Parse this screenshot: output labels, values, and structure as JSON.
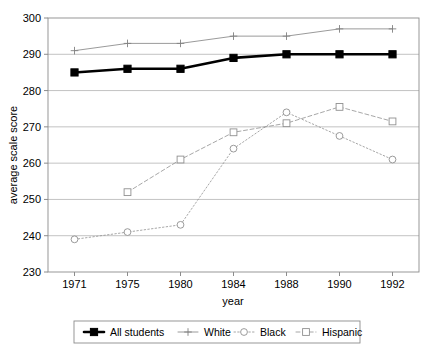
{
  "chart_data": {
    "type": "line",
    "title": "",
    "xlabel": "year",
    "ylabel": "average scale score",
    "categories": [
      "1971",
      "1975",
      "1980",
      "1984",
      "1988",
      "1990",
      "1992"
    ],
    "ylim": [
      230,
      300
    ],
    "yticks": [
      "230",
      "240",
      "250",
      "260",
      "270",
      "280",
      "290",
      "300"
    ],
    "grid": true,
    "legend_position": "bottom",
    "series": [
      {
        "name": "All students",
        "marker": "filled-square",
        "line_style": "solid",
        "color": "#000000",
        "line_width": 2.6,
        "values": [
          285,
          286,
          286,
          289,
          290,
          290,
          290
        ]
      },
      {
        "name": "White",
        "marker": "plus",
        "line_style": "solid",
        "color": "#808080",
        "line_width": 0.8,
        "values": [
          291,
          293,
          293,
          295,
          295,
          297,
          297
        ]
      },
      {
        "name": "Black",
        "marker": "open-circle",
        "line_style": "dotted",
        "color": "#909090",
        "line_width": 0.8,
        "values": [
          239,
          241,
          243,
          264,
          274,
          267.5,
          261
        ]
      },
      {
        "name": "Hispanic",
        "marker": "open-square",
        "line_style": "dashed",
        "color": "#909090",
        "line_width": 0.8,
        "values": [
          null,
          252,
          261,
          268.5,
          271,
          275.5,
          271.5
        ]
      }
    ]
  },
  "legend": {
    "items": [
      {
        "label": "All students"
      },
      {
        "label": "White"
      },
      {
        "label": "Black"
      },
      {
        "label": "Hispanic"
      }
    ]
  }
}
